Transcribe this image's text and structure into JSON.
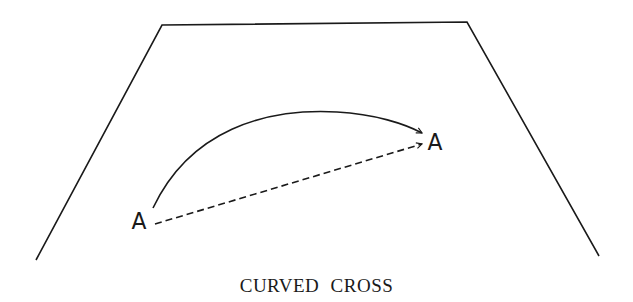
{
  "figure": {
    "caption": "CURVED CROSS",
    "colors": {
      "ink": "#1a1a1a",
      "background": "#ffffff"
    },
    "court_outline": {
      "shape": "trapezoid",
      "points": [
        [
          36,
          260
        ],
        [
          162,
          25
        ],
        [
          467,
          22
        ],
        [
          599,
          256
        ]
      ]
    },
    "points": {
      "start_label": "A",
      "end_label": "A"
    },
    "paths": [
      {
        "name": "curved-path",
        "style": "solid",
        "arrow": "open"
      },
      {
        "name": "straight-path",
        "style": "dashed",
        "arrow": "open"
      }
    ]
  }
}
